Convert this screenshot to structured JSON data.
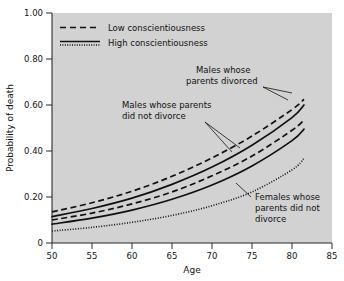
{
  "chart_data": {
    "type": "line",
    "title": "",
    "xlabel": "Age",
    "ylabel": "Probability of death",
    "xlim": [
      50,
      85
    ],
    "ylim": [
      0,
      1.0
    ],
    "xticks": [
      50,
      55,
      60,
      65,
      70,
      75,
      80,
      85
    ],
    "xtick_labels": [
      "50",
      "55",
      "60",
      "65",
      "70",
      "75",
      "80",
      "85"
    ],
    "yticks": [
      0,
      0.2,
      0.4,
      0.6,
      0.8,
      1.0
    ],
    "ytick_labels": [
      "0",
      "0.20",
      "0.40",
      "0.60",
      "0.80",
      "1.00"
    ],
    "grid": false,
    "legend_position": "top-left",
    "plot_background": "#d2d2d2",
    "line_color": "#111111",
    "x": [
      50,
      55,
      60,
      65,
      70,
      75,
      80,
      81.5
    ],
    "series": [
      {
        "name": "Males whose parents divorced, low conscientiousness",
        "style": "dashed",
        "values": [
          0.135,
          0.175,
          0.225,
          0.29,
          0.37,
          0.465,
          0.58,
          0.625
        ]
      },
      {
        "name": "Males whose parents divorced, high conscientiousness",
        "style": "solid",
        "values": [
          0.115,
          0.15,
          0.195,
          0.255,
          0.33,
          0.425,
          0.545,
          0.6
        ]
      },
      {
        "name": "Males whose parents did not divorce, low conscientiousness",
        "style": "dashed",
        "values": [
          0.1,
          0.13,
          0.17,
          0.222,
          0.292,
          0.378,
          0.49,
          0.535
        ]
      },
      {
        "name": "Males whose parents did not divorce, high conscientiousness",
        "style": "solid",
        "values": [
          0.082,
          0.108,
          0.143,
          0.19,
          0.252,
          0.335,
          0.445,
          0.495
        ]
      },
      {
        "name": "Females whose parents did not divorce",
        "style": "dotted",
        "values": [
          0.052,
          0.068,
          0.09,
          0.12,
          0.162,
          0.222,
          0.318,
          0.368
        ]
      }
    ],
    "legend": [
      {
        "label": "Low conscientiousness",
        "style": "dashed"
      },
      {
        "label": "High conscientiousness",
        "style": "solid-dotted"
      }
    ],
    "annotations": [
      {
        "id": "males-divorced",
        "lines": [
          "Males whose",
          "parents divorced"
        ]
      },
      {
        "id": "males-not-divorced",
        "lines": [
          "Males whose parents",
          "did not divorce"
        ]
      },
      {
        "id": "females-not-divorced",
        "lines": [
          "Females whose",
          "parents did not",
          "divorce"
        ]
      }
    ]
  }
}
